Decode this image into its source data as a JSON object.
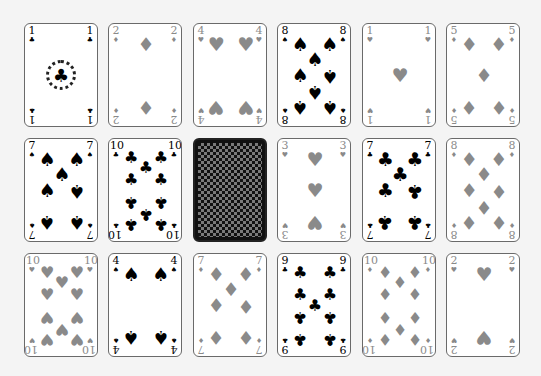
{
  "game": {
    "name": "card-layout",
    "colors": {
      "black_suit": "#000000",
      "red_suit_rendered": "#8a8a8a",
      "card_border": "#6a6a6a",
      "background": "#f4f4f4",
      "back_dark": "#111111",
      "back_light": "#7a7a7a"
    },
    "suit_glyphs": {
      "clubs": "♣",
      "spades": "♠",
      "hearts": "♥",
      "diamonds": "♦"
    },
    "rows": [
      [
        {
          "rank": "1",
          "suit": "clubs",
          "face_up": true
        },
        {
          "rank": "2",
          "suit": "diamonds",
          "face_up": true
        },
        {
          "rank": "4",
          "suit": "hearts",
          "face_up": true
        },
        {
          "rank": "8",
          "suit": "spades",
          "face_up": true
        },
        {
          "rank": "1",
          "suit": "hearts",
          "face_up": true
        },
        {
          "rank": "5",
          "suit": "diamonds",
          "face_up": true
        }
      ],
      [
        {
          "rank": "7",
          "suit": "spades",
          "face_up": true
        },
        {
          "rank": "10",
          "suit": "clubs",
          "face_up": true
        },
        {
          "rank": "",
          "suit": "",
          "face_up": false
        },
        {
          "rank": "3",
          "suit": "hearts",
          "face_up": true
        },
        {
          "rank": "7",
          "suit": "clubs",
          "face_up": true
        },
        {
          "rank": "8",
          "suit": "diamonds",
          "face_up": true
        }
      ],
      [
        {
          "rank": "10",
          "suit": "hearts",
          "face_up": true
        },
        {
          "rank": "4",
          "suit": "spades",
          "face_up": true
        },
        {
          "rank": "7",
          "suit": "diamonds",
          "face_up": true
        },
        {
          "rank": "9",
          "suit": "clubs",
          "face_up": true
        },
        {
          "rank": "10",
          "suit": "diamonds",
          "face_up": true
        },
        {
          "rank": "2",
          "suit": "hearts",
          "face_up": true
        }
      ]
    ]
  }
}
